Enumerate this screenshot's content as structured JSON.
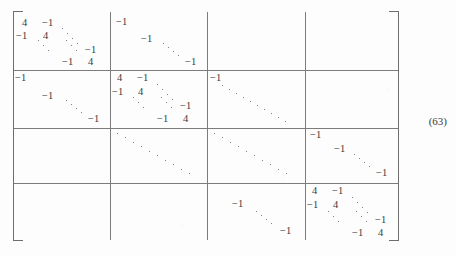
{
  "figure": {
    "kind": "block-matrix",
    "equation_number": "(63)",
    "bracket_left": "[",
    "bracket_right": "]",
    "block_rows": 4,
    "block_cols": 4,
    "diagonal_value": "4",
    "offdiagonal_value": "-1"
  },
  "blocks": {
    "b11": {
      "name": "block-1-1",
      "type": "tridiagonal",
      "entries": [
        {
          "text": "4",
          "x": 8,
          "y": 6
        },
        {
          "text": "−1",
          "x": 28,
          "y": 6
        },
        {
          "text": "−1",
          "x": 4,
          "y": 20
        },
        {
          "text": "4",
          "x": 28,
          "y": 20
        },
        {
          "text": "−1",
          "x": 72,
          "y": 34
        },
        {
          "text": "−1",
          "x": 50,
          "y": 48
        },
        {
          "text": "4",
          "x": 74,
          "y": 48
        }
      ]
    },
    "b12": {
      "name": "block-1-2",
      "type": "diagonal-negative",
      "entries": [
        {
          "text": "−1",
          "x": 6,
          "y": 6
        },
        {
          "text": "−1",
          "x": 30,
          "y": 22
        },
        {
          "text": "−1",
          "x": 74,
          "y": 48
        }
      ]
    },
    "b13": {
      "name": "block-1-3",
      "type": "empty",
      "entries": []
    },
    "b14": {
      "name": "block-1-4",
      "type": "empty",
      "entries": []
    },
    "b21": {
      "name": "block-2-1",
      "type": "diagonal-negative",
      "entries": [
        {
          "text": "−1",
          "x": 3,
          "y": 4
        },
        {
          "text": "−1",
          "x": 30,
          "y": 22
        },
        {
          "text": "−1",
          "x": 74,
          "y": 42
        }
      ]
    },
    "b22": {
      "name": "block-2-2",
      "type": "tridiagonal",
      "entries": [
        {
          "text": "4",
          "x": 6,
          "y": 4
        },
        {
          "text": "−1",
          "x": 26,
          "y": 4
        },
        {
          "text": "−1",
          "x": 2,
          "y": 18
        },
        {
          "text": "4",
          "x": 26,
          "y": 18
        },
        {
          "text": "−1",
          "x": 70,
          "y": 30
        },
        {
          "text": "−1",
          "x": 48,
          "y": 44
        },
        {
          "text": "4",
          "x": 72,
          "y": 44
        }
      ]
    },
    "b23": {
      "name": "block-2-3",
      "type": "diagonal-negative",
      "entries": [
        {
          "text": "−1",
          "x": 3,
          "y": 4
        }
      ]
    },
    "b24": {
      "name": "block-2-4",
      "type": "empty",
      "entries": []
    },
    "b31": {
      "name": "block-3-1",
      "type": "empty",
      "entries": []
    },
    "b32": {
      "name": "block-3-2",
      "type": "diagonal-negative",
      "entries": []
    },
    "b33": {
      "name": "block-3-3",
      "type": "diagonal-negative",
      "entries": []
    },
    "b34": {
      "name": "block-3-4",
      "type": "diagonal-negative",
      "entries": [
        {
          "text": "−1",
          "x": 6,
          "y": 2
        },
        {
          "text": "−1",
          "x": 30,
          "y": 16
        },
        {
          "text": "−1",
          "x": 74,
          "y": 40
        }
      ]
    },
    "b41": {
      "name": "block-4-1",
      "type": "empty",
      "entries": []
    },
    "b42": {
      "name": "block-4-2",
      "type": "empty",
      "entries": []
    },
    "b43": {
      "name": "block-4-3",
      "type": "diagonal-negative",
      "entries": [
        {
          "text": "−1",
          "x": 26,
          "y": 16
        },
        {
          "text": "−1",
          "x": 72,
          "y": 44
        }
      ]
    },
    "b44": {
      "name": "block-4-4",
      "type": "tridiagonal",
      "entries": [
        {
          "text": "4",
          "x": 6,
          "y": 2
        },
        {
          "text": "−1",
          "x": 26,
          "y": 2
        },
        {
          "text": "−1",
          "x": 2,
          "y": 16
        },
        {
          "text": "4",
          "x": 26,
          "y": 16
        },
        {
          "text": "−1",
          "x": 70,
          "y": 30
        },
        {
          "text": "−1",
          "x": 48,
          "y": 44
        },
        {
          "text": "4",
          "x": 72,
          "y": 44
        }
      ]
    }
  }
}
